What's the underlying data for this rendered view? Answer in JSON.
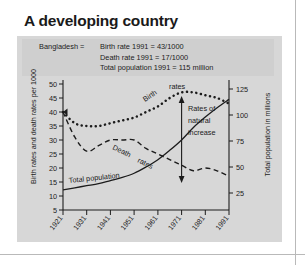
{
  "title": "A developing country",
  "legend": {
    "country_label": "Bangladesh =",
    "facts": [
      "Birth rate 1991 = 43/1000",
      "Death rate 1991 = 17/1000",
      "Total population 1991 = 115 million"
    ]
  },
  "chart_data": {
    "type": "line",
    "title": "A developing country",
    "xlabel": "",
    "ylabel": "Birth rates and death rates per 1000",
    "y2label": "Total population in millions",
    "xlim": [
      1921,
      1991
    ],
    "ylim": [
      0,
      52
    ],
    "y2lim": [
      0,
      130
    ],
    "grid": false,
    "legend_position": "inline-annotations",
    "x_tick_labels": [
      "1921",
      "1931",
      "1941",
      "1951",
      "1961",
      "1971",
      "1981",
      "1991"
    ],
    "y_tick_labels": [
      "5",
      "10",
      "15",
      "20",
      "25",
      "30",
      "35",
      "40",
      "45",
      "50"
    ],
    "y_ticks": [
      5,
      10,
      15,
      20,
      25,
      30,
      35,
      40,
      45,
      50
    ],
    "y2_tick_labels": [
      "25",
      "50",
      "75",
      "100",
      "125"
    ],
    "y2_ticks": [
      25,
      50,
      75,
      100,
      125
    ],
    "x": [
      1921,
      1926,
      1931,
      1936,
      1941,
      1946,
      1951,
      1956,
      1961,
      1966,
      1971,
      1976,
      1981,
      1986,
      1991
    ],
    "series": [
      {
        "name": "Birth rates",
        "style": "dotted",
        "axis": "left",
        "values": [
          40,
          36,
          35,
          35,
          36,
          37,
          38,
          40,
          42,
          45,
          47,
          47,
          46,
          45,
          43
        ]
      },
      {
        "name": "Death rates",
        "style": "dashed",
        "axis": "left",
        "values": [
          40,
          31,
          26,
          28,
          30,
          30,
          30,
          27,
          25,
          23,
          21,
          19,
          20,
          19,
          17
        ]
      },
      {
        "name": "Total population",
        "style": "solid",
        "axis": "right",
        "values": [
          28,
          30,
          32,
          34,
          37,
          40,
          44,
          50,
          57,
          66,
          76,
          88,
          98,
          107,
          115
        ]
      }
    ],
    "annotations": [
      {
        "text": "Birth",
        "kind": "curve-label"
      },
      {
        "text": "rates",
        "kind": "curve-label"
      },
      {
        "text": "Death",
        "kind": "curve-label"
      },
      {
        "text": "rates",
        "kind": "curve-label"
      },
      {
        "text": "Total population",
        "kind": "curve-label"
      },
      {
        "text": "Rates of",
        "kind": "arrow-label"
      },
      {
        "text": "natural",
        "kind": "arrow-label"
      },
      {
        "text": "increase",
        "kind": "arrow-label"
      }
    ]
  },
  "colors": {
    "panel": "#d7d7d7",
    "legend_box": "#cfcfcf",
    "ink": "#1c1c1c",
    "page": "#ffffff"
  }
}
